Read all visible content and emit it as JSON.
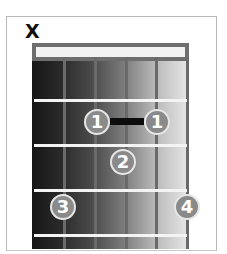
{
  "diagram": {
    "type": "guitar-chord-chart",
    "muted_string_marker": "X",
    "strings": 6,
    "frets_shown": 4,
    "barre": {
      "finger": "1",
      "fret": 1,
      "from_string": 2,
      "to_string": 4
    },
    "fingers": [
      {
        "label": "1",
        "fret": 1,
        "string": 2
      },
      {
        "label": "1",
        "fret": 1,
        "string": 4
      },
      {
        "label": "2",
        "fret": 2,
        "string": 3
      },
      {
        "label": "3",
        "fret": 3,
        "string": 1
      },
      {
        "label": "4",
        "fret": 3,
        "string": 5
      }
    ],
    "colors": {
      "dot_fill": "#8a8a8a",
      "dot_ring": "#e6e6e6",
      "barre": "#0c0c0c",
      "fret": "#f4f4f4",
      "string": "#6a6a6a"
    }
  }
}
